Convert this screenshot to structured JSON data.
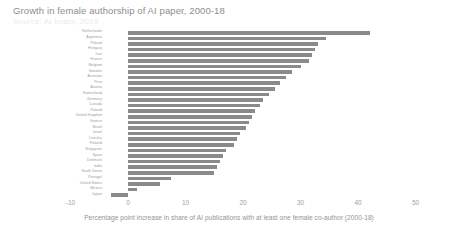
{
  "chart_data": {
    "type": "bar",
    "orientation": "horizontal",
    "title": "Growth in female authorship of AI paper, 2000-18",
    "subtitle": "Source: AI Index, 2019",
    "xlabel": "Percentage point increase in share of AI publications with at least one female co-author (2000-18)",
    "ylabel": "",
    "xlim": [
      -10,
      50
    ],
    "xticks": [
      -10,
      0,
      10,
      20,
      30,
      40,
      50
    ],
    "xticklabels": [
      "-10",
      "0",
      "10",
      "20",
      "30",
      "40",
      "50"
    ],
    "grid": false,
    "legend": "none",
    "bar_color": "#8a8a8a",
    "categories": [
      "Netherlands",
      "Argentina",
      "Poland",
      "Hungary",
      "Iran",
      "France",
      "Belgium",
      "Sweden",
      "Australia",
      "Peru",
      "Austria",
      "Switzerland",
      "Germany",
      "Canada",
      "Poland",
      "United Kingdom",
      "Greece",
      "Brazil",
      "Israel",
      "Czechia",
      "Finland",
      "Singapore",
      "Spain",
      "Denmark",
      "India",
      "South Korea",
      "Portugal",
      "United States",
      "Mexico",
      "Japan"
    ],
    "values": [
      42.0,
      34.5,
      33.0,
      32.5,
      32.0,
      31.5,
      30.0,
      28.5,
      27.5,
      26.5,
      25.5,
      24.5,
      23.5,
      23.0,
      22.0,
      21.5,
      21.0,
      20.5,
      19.5,
      19.0,
      18.5,
      17.0,
      16.5,
      16.0,
      15.5,
      15.0,
      7.5,
      5.5,
      1.5,
      -3.0
    ]
  }
}
